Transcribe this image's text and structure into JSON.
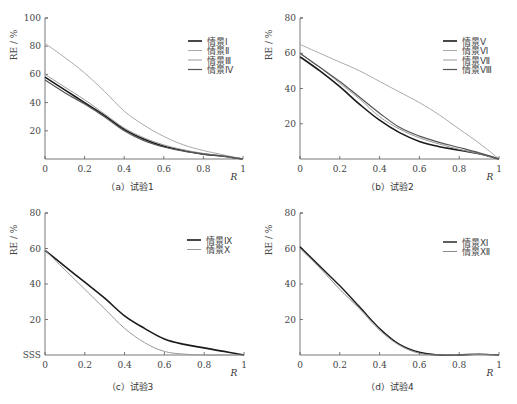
{
  "chart_data": [
    {
      "type": "line",
      "panel": "a",
      "caption": "（a）试验1",
      "xlabel": "R",
      "ylabel": "RE / %",
      "xlim": [
        0,
        1
      ],
      "ylim": [
        0,
        100
      ],
      "xticks": [
        "0",
        "0.2",
        "0.4",
        "0.6",
        "0.8",
        "1"
      ],
      "yticks": [
        "20",
        "40",
        "60",
        "80",
        "100"
      ],
      "grid": false,
      "legend_position": "upper right",
      "x": [
        0,
        0.1,
        0.2,
        0.3,
        0.4,
        0.5,
        0.6,
        0.7,
        0.8,
        0.9,
        1.0
      ],
      "series": [
        {
          "name": "情景Ⅰ",
          "color": "#1a1a1a",
          "width": 1.6,
          "values": [
            58,
            49,
            40,
            31,
            21,
            14,
            9,
            6,
            3.5,
            2,
            0
          ]
        },
        {
          "name": "情景Ⅱ",
          "color": "#aaaaaa",
          "width": 1.0,
          "values": [
            82,
            72,
            61,
            48,
            34,
            24,
            16,
            10,
            6,
            3,
            0
          ]
        },
        {
          "name": "情景Ⅲ",
          "color": "#999999",
          "width": 1.0,
          "values": [
            60,
            51,
            42,
            32,
            22,
            15,
            10,
            6.5,
            4,
            2,
            0
          ]
        },
        {
          "name": "情景Ⅳ",
          "color": "#555555",
          "width": 1.2,
          "values": [
            56,
            47,
            39,
            30,
            20,
            13,
            8.5,
            5.5,
            3.5,
            2,
            0
          ]
        }
      ]
    },
    {
      "type": "line",
      "panel": "b",
      "caption": "（b）试验2",
      "xlabel": "R",
      "ylabel": "RE / %",
      "xlim": [
        0,
        1
      ],
      "ylim": [
        0,
        80
      ],
      "xticks": [
        "0",
        "0.2",
        "0.4",
        "0.6",
        "0.8",
        "1"
      ],
      "yticks": [
        "20",
        "40",
        "60",
        "80"
      ],
      "grid": false,
      "legend_position": "upper right",
      "x": [
        0,
        0.1,
        0.2,
        0.3,
        0.4,
        0.5,
        0.6,
        0.7,
        0.8,
        0.9,
        1.0
      ],
      "series": [
        {
          "name": "情景Ⅴ",
          "color": "#1a1a1a",
          "width": 1.6,
          "values": [
            58,
            50,
            41,
            31,
            22,
            15,
            10,
            7,
            5,
            3,
            0
          ]
        },
        {
          "name": "情景Ⅵ",
          "color": "#aaaaaa",
          "width": 1.0,
          "values": [
            65,
            60,
            55,
            50,
            44,
            38,
            32,
            25,
            17,
            9,
            0
          ]
        },
        {
          "name": "情景Ⅶ",
          "color": "#999999",
          "width": 1.0,
          "values": [
            60,
            52,
            43,
            34,
            24,
            17,
            12,
            8.5,
            5.5,
            3,
            0
          ]
        },
        {
          "name": "情景Ⅷ",
          "color": "#555555",
          "width": 1.2,
          "values": [
            60,
            52,
            44,
            35,
            26,
            18,
            13,
            9.5,
            6.5,
            3.5,
            0
          ]
        }
      ]
    },
    {
      "type": "line",
      "panel": "c",
      "caption": "（c）试验3",
      "xlabel": "R",
      "ylabel": "RE / %",
      "xlim": [
        0,
        1
      ],
      "ylim": [
        0,
        80
      ],
      "xticks": [
        "0",
        "0.2",
        "0.4",
        "0.6",
        "0.8",
        "1"
      ],
      "yticks": [
        "SSS",
        "20",
        "40",
        "60",
        "80"
      ],
      "grid": false,
      "legend_position": "upper right",
      "x": [
        0,
        0.1,
        0.2,
        0.3,
        0.4,
        0.5,
        0.6,
        0.7,
        0.8,
        0.9,
        1.0
      ],
      "series": [
        {
          "name": "情景Ⅸ",
          "color": "#1a1a1a",
          "width": 1.6,
          "values": [
            59,
            50,
            41,
            32,
            22,
            15,
            9,
            6,
            4,
            2,
            0
          ]
        },
        {
          "name": "情景Ⅹ",
          "color": "#999999",
          "width": 1.0,
          "values": [
            59,
            48,
            37,
            26,
            15,
            7,
            2,
            0.5,
            0,
            0,
            0
          ]
        }
      ]
    },
    {
      "type": "line",
      "panel": "d",
      "caption": "（d）试验4",
      "xlabel": "R",
      "ylabel": "RE / %",
      "xlim": [
        0,
        1
      ],
      "ylim": [
        0,
        80
      ],
      "xticks": [
        "0",
        "0.2",
        "0.4",
        "0.6",
        "0.8",
        "1"
      ],
      "yticks": [
        "20",
        "40",
        "60",
        "80"
      ],
      "grid": false,
      "legend_position": "upper right",
      "x": [
        0,
        0.1,
        0.2,
        0.3,
        0.4,
        0.5,
        0.6,
        0.7,
        0.8,
        0.9,
        1.0
      ],
      "series": [
        {
          "name": "情景Ⅺ",
          "color": "#1a1a1a",
          "width": 1.4,
          "values": [
            61,
            50,
            39,
            27,
            15,
            6,
            1.5,
            0,
            0,
            0.5,
            0
          ]
        },
        {
          "name": "情景Ⅻ",
          "color": "#888888",
          "width": 1.0,
          "values": [
            60,
            49,
            37,
            26,
            14,
            5.5,
            1,
            0,
            0,
            0.3,
            0
          ]
        }
      ]
    }
  ],
  "panels": {
    "a": {
      "caption": "（a）试验1",
      "ylabel": "RE / %",
      "xlabel": "R"
    },
    "b": {
      "caption": "（b）试验2",
      "ylabel": "RE / %",
      "xlabel": "R"
    },
    "c": {
      "caption": "（c）试验3",
      "ylabel": "RE / %",
      "xlabel": "R"
    },
    "d": {
      "caption": "（d）试验4",
      "ylabel": "RE / %",
      "xlabel": "R"
    }
  }
}
